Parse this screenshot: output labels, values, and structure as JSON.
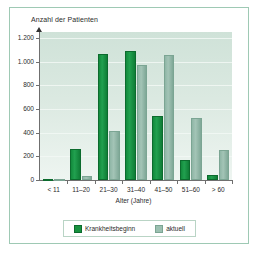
{
  "chart_data": {
    "type": "bar",
    "title": "",
    "xlabel": "Alter (Jahre)",
    "ylabel": "Anzahl der Patienten",
    "categories": [
      "< 11",
      "11–20",
      "21–30",
      "31–40",
      "41–50",
      "51–60",
      "> 60"
    ],
    "series": [
      {
        "name": "Krankheitsbeginn",
        "color": "#17923f",
        "values": [
          5,
          260,
          1065,
          1090,
          540,
          165,
          45
        ]
      },
      {
        "name": "aktuell",
        "color": "#9cc0b1",
        "values": [
          5,
          30,
          410,
          975,
          1055,
          520,
          255
        ]
      }
    ],
    "ylim": [
      0,
      1250
    ],
    "yticks": [
      0,
      200,
      400,
      600,
      800,
      1000,
      1200
    ],
    "ytick_labels": [
      "0",
      "200",
      "400",
      "600",
      "800",
      "1.000",
      "1.200"
    ],
    "grid": true,
    "legend_position": "bottom",
    "legend": [
      "Krankheitsbeginn",
      "aktuell"
    ]
  }
}
